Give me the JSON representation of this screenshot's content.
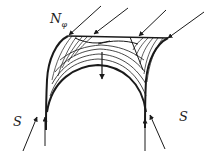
{
  "diagram": {
    "type": "shell-vault-force-diagram",
    "labels": {
      "meridional_force": "N",
      "meridional_force_subscript": "φ",
      "support_left": "S",
      "support_right": "S"
    },
    "colors": {
      "stroke": "#1a1a1a",
      "background": "#ffffff"
    }
  }
}
